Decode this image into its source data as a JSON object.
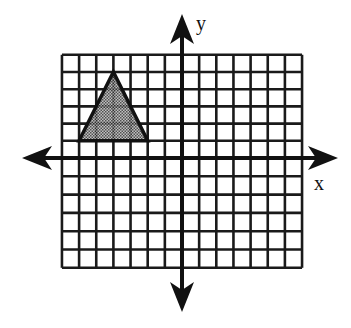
{
  "diagram": {
    "type": "coordinate-grid",
    "x_axis_label": "x",
    "y_axis_label": "y",
    "grid": {
      "x_min": -7,
      "x_max": 7,
      "y_min": -6,
      "y_max": 6
    },
    "colors": {
      "grid": "#1a1a1a",
      "axis": "#111111",
      "shape_fill": "#8a8a8a",
      "shape_stroke": "#111111"
    },
    "shapes": [
      {
        "name": "triangle",
        "fill": "shaded",
        "vertices": [
          [
            -6,
            1
          ],
          [
            -2,
            1
          ],
          [
            -4,
            5
          ]
        ]
      }
    ]
  }
}
